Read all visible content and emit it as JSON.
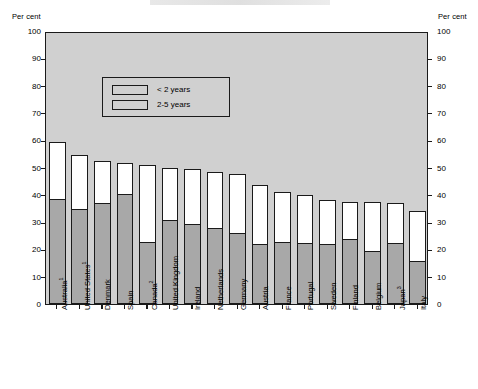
{
  "axis": {
    "unit_left": "Per cent",
    "unit_right": "Per cent",
    "ticks": [
      0,
      10,
      20,
      30,
      40,
      50,
      60,
      70,
      80,
      90,
      100
    ]
  },
  "legend": {
    "items": [
      {
        "label": "< 2 years",
        "color": "#a8a8a8"
      },
      {
        "label": "2-5 years",
        "color": "#ffffff"
      }
    ]
  },
  "colors": {
    "plot_background": "#d0d0d0",
    "lower_segment": "#a8a8a8",
    "upper_segment": "#ffffff",
    "outline": "#1a1a1a",
    "page_background": "#ffffff"
  },
  "chart_data": {
    "type": "bar",
    "subtype": "stacked-vertical",
    "title": "",
    "xlabel": "",
    "ylabel": "Per cent",
    "ylim": [
      0,
      100
    ],
    "ytick_step": 10,
    "grid": false,
    "legend_position": "top-left-inside",
    "dual_axis": true,
    "categories": [
      "Australia",
      "United States",
      "Denmark",
      "Spain",
      "Canada",
      "United Kingdom",
      "Ireland",
      "Netherlands",
      "Germany",
      "Austria",
      "France",
      "Portugal",
      "Sweden",
      "Finland",
      "Belgium",
      "Japan",
      "Italy"
    ],
    "category_footnotes": [
      "1",
      "1",
      "",
      "",
      "2",
      "",
      "",
      "",
      "",
      "",
      "",
      "",
      "",
      "",
      "",
      "3",
      ""
    ],
    "series": [
      {
        "name": "< 2 years",
        "color": "#a8a8a8",
        "values": [
          38.0,
          34.5,
          36.5,
          40.0,
          22.5,
          30.5,
          29.0,
          27.5,
          25.5,
          21.5,
          22.5,
          22.0,
          21.5,
          23.5,
          19.0,
          22.0,
          15.5
        ]
      },
      {
        "name": "2-5 years",
        "color": "#ffffff",
        "values": [
          21.5,
          20.0,
          16.0,
          11.5,
          28.5,
          19.5,
          20.5,
          21.0,
          22.0,
          22.0,
          18.5,
          18.0,
          16.5,
          14.0,
          18.5,
          15.0,
          18.5
        ]
      }
    ],
    "totals": [
      59.5,
      54.5,
      52.5,
      51.5,
      51.0,
      50.0,
      49.5,
      48.5,
      47.5,
      43.5,
      41.0,
      40.0,
      38.0,
      37.5,
      37.5,
      37.0,
      34.0
    ]
  }
}
